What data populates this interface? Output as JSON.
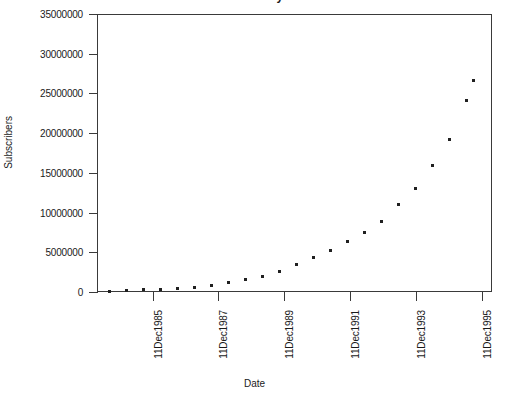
{
  "chart_data": {
    "type": "scatter",
    "title": "",
    "xlabel": "Date",
    "ylabel": "Subscribers",
    "grid": false,
    "legend": "none",
    "marker": "square",
    "marker_color": "#202020",
    "axis_color": "#3a3a3a",
    "background": "#ffffff",
    "ylim": [
      0,
      35000000
    ],
    "y_ticks": [
      0,
      5000000,
      10000000,
      15000000,
      20000000,
      25000000,
      30000000,
      35000000
    ],
    "y_tick_labels": [
      "0",
      "5000000",
      "10000000",
      "15000000",
      "20000000",
      "25000000",
      "30000000",
      "35000000"
    ],
    "x_ticks": [
      "11Dec1985",
      "11Dec1987",
      "11Dec1989",
      "11Dec1991",
      "11Dec1993",
      "11Dec1995"
    ],
    "x_tick_labels": [
      "11Dec1985",
      "11Dec1987",
      "11Dec1989",
      "11Dec1991",
      "11Dec1993",
      "11Dec1995"
    ],
    "xlim": [
      "11Dec1984",
      "11Dec1996"
    ],
    "x": [
      "11Jun1984",
      "11Dec1984",
      "11Jun1985",
      "11Dec1985",
      "11Jun1986",
      "11Dec1986",
      "11Jun1987",
      "11Dec1987",
      "11Jun1988",
      "11Dec1988",
      "11Jun1989",
      "11Dec1989",
      "11Jun1990",
      "11Dec1990",
      "11Jun1991",
      "11Dec1991",
      "11Jun1992",
      "11Dec1992",
      "11Jun1993",
      "11Dec1993",
      "11Jun1994",
      "11Dec1994",
      "11Jun1995"
    ],
    "values": [
      92000,
      150000,
      250000,
      340000,
      500000,
      682000,
      900000,
      1231000,
      1600000,
      2069000,
      2700000,
      3509000,
      4400000,
      5283000,
      6400000,
      7557000,
      8900000,
      11033000,
      13100000,
      16009000,
      19300000,
      24134000,
      28154000
    ],
    "points_px": [
      {
        "x": 12,
        "y": 277
      },
      {
        "x": 29,
        "y": 276
      },
      {
        "x": 46,
        "y": 275
      },
      {
        "x": 63,
        "y": 275
      },
      {
        "x": 80,
        "y": 274
      },
      {
        "x": 97,
        "y": 273
      },
      {
        "x": 114,
        "y": 271
      },
      {
        "x": 131,
        "y": 268
      },
      {
        "x": 148,
        "y": 265
      },
      {
        "x": 165,
        "y": 262
      },
      {
        "x": 182,
        "y": 257
      },
      {
        "x": 199,
        "y": 250
      },
      {
        "x": 216,
        "y": 243
      },
      {
        "x": 233,
        "y": 236
      },
      {
        "x": 250,
        "y": 227
      },
      {
        "x": 267,
        "y": 218
      },
      {
        "x": 284,
        "y": 207
      },
      {
        "x": 301,
        "y": 190
      },
      {
        "x": 318,
        "y": 174
      },
      {
        "x": 335,
        "y": 151
      },
      {
        "x": 352,
        "y": 125
      },
      {
        "x": 369,
        "y": 86
      },
      {
        "x": 376,
        "y": 66
      }
    ]
  },
  "axis": {
    "y_title": "Subscribers",
    "x_title": "Date"
  },
  "figure": {
    "title_fragment": "Subscribers by Date"
  }
}
